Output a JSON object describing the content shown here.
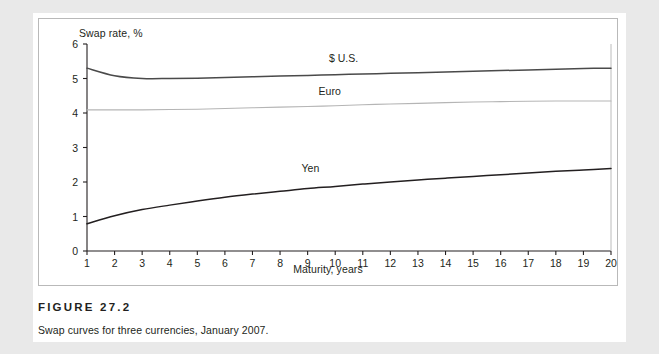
{
  "figure": {
    "number_label": "FIGURE 27.2",
    "caption": "Swap curves for three currencies, January 2007."
  },
  "chart_data": {
    "type": "line",
    "title": "",
    "xlabel": "Maturity, years",
    "ylabel": "Swap rate, %",
    "xlim": [
      1,
      20
    ],
    "ylim": [
      0,
      6
    ],
    "grid": false,
    "legend_position": "inline-labels",
    "x": [
      1,
      2,
      3,
      4,
      5,
      6,
      7,
      8,
      9,
      10,
      11,
      12,
      13,
      14,
      15,
      16,
      17,
      18,
      19,
      20
    ],
    "xticks": [
      "1",
      "2",
      "3",
      "4",
      "5",
      "6",
      "7",
      "8",
      "9",
      "10",
      "11",
      "12",
      "13",
      "14",
      "15",
      "16",
      "17",
      "18",
      "19",
      "20"
    ],
    "yticks": [
      "0",
      "1",
      "2",
      "3",
      "4",
      "5",
      "6"
    ],
    "series": [
      {
        "name": "$ U.S.",
        "color": "#4a4a4a",
        "label_x": 10.3,
        "label_y": 5.48,
        "values": [
          5.3,
          5.08,
          5.0,
          5.0,
          5.01,
          5.03,
          5.05,
          5.07,
          5.09,
          5.11,
          5.13,
          5.15,
          5.17,
          5.19,
          5.21,
          5.23,
          5.25,
          5.27,
          5.29,
          5.3
        ]
      },
      {
        "name": "Euro",
        "color": "#b5b5b5",
        "label_x": 9.8,
        "label_y": 4.52,
        "values": [
          4.09,
          4.09,
          4.09,
          4.1,
          4.11,
          4.13,
          4.15,
          4.17,
          4.19,
          4.21,
          4.24,
          4.26,
          4.28,
          4.3,
          4.32,
          4.33,
          4.34,
          4.35,
          4.35,
          4.35
        ]
      },
      {
        "name": "Yen",
        "color": "#231f20",
        "label_x": 9.1,
        "label_y": 2.3,
        "values": [
          0.79,
          1.02,
          1.2,
          1.33,
          1.45,
          1.56,
          1.65,
          1.73,
          1.81,
          1.87,
          1.94,
          2.0,
          2.06,
          2.11,
          2.16,
          2.21,
          2.26,
          2.31,
          2.35,
          2.39
        ]
      }
    ]
  }
}
